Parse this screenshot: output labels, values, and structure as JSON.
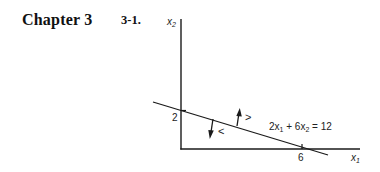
{
  "header": {
    "chapter": "Chapter 3",
    "problem_number": "3-1."
  },
  "figure": {
    "axes": {
      "y_label_main": "x",
      "y_label_sub": "2",
      "x_label_main": "x",
      "x_label_sub": "1"
    },
    "ticks": {
      "y_intercept": "2",
      "x_intercept": "6"
    },
    "constraint": {
      "equation_parts": [
        "2x",
        "1",
        " + 6x",
        "2",
        " = 12"
      ],
      "equation_text": "2x1 + 6x2 = 12"
    },
    "region_labels": {
      "greater": ">",
      "less": "<"
    },
    "colors": {
      "ink": "#1a1a1a",
      "background": "#ffffff"
    }
  }
}
